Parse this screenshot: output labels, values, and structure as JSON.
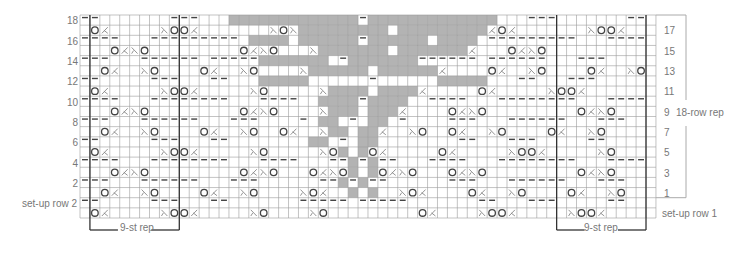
{
  "chart_data": {
    "type": "knitting-chart",
    "columns": 58,
    "rows_total": 20,
    "legend_symbols": {
      ".": "knit",
      "-": "purl",
      "o": "yarn-over",
      "/": "k2tog",
      "\\": "ssk",
      "#": "no-stitch"
    },
    "grid": [
      "--.......---...#############-#############...---.......--",
      ".o/.....\\oo/.......\\o\\#########.#########/o/.......\\oo/...",
      "----...---------.####.######-######.####.---------...----",
      "...o/\\o.........o/\\o...\\#######.#######/...o/\\o.........",
      "---...------.-----#######.-#######------.------...---....",
      "..o/..\\o....o/..\\o....\\######.######/....o/..\\o....o/..\\o",
      "--.....---...--...#####......-......#####...--...---.....",
      ".o/.....\\oo/.....\\o.....\\####.####/.....o/.....\\oo/.....",
      "----...--------...----..####-####..----...--------...----",
      "...o/\\o.........o/\\o....\\###.###/....o/\\o.........o/\\o..",
      "---...------...---....-.##.-.##.-....---...------...---..",
      "..o/..\\o....o/..\\o..o/..\\##.##/..\\o..o/..\\o....o/..\\o...",
      "--.....---...--........##.-.##........--...---.....--....",
      ".o/.....\\oo/.....\\o.....\\o#.#o/.....o/.....\\oo/.....\\o...",
      "----...--------...----...--#-#--...----...--------...----",
      "...o/\\o.........o/\\o...o/\\o#.#o/\\o...o/\\o.........o/\\o...",
      "---...------...---......--#-#--......---...------...---..",
      "..o/..\\o....o/..\\o....\\o/..#.#..\\o/....o/..\\o....o/..\\o..",
      "--.....---...--.......-----.-----.......--...---.....--..",
      ".o/.....\\oo/.....\\o....\\o.........o/....\\oo/.....\\oo/.....\\o."
    ]
  },
  "labels": {
    "left_rows": [
      "18",
      "16",
      "14",
      "12",
      "10",
      "8",
      "6",
      "4",
      "2",
      "set-up row 2"
    ],
    "right_rows": [
      "17",
      "15",
      "13",
      "11",
      "9",
      "7",
      "5",
      "3",
      "1",
      "set-up row 1"
    ],
    "row_rep": "18-row rep",
    "st_rep_left": "9-st rep",
    "st_rep_right": "9-st rep"
  },
  "colors": {
    "grid_line": "#9a9a9a",
    "thick_line": "#333333",
    "no_stitch": "#b3b3b3",
    "symbol": "#444444",
    "label": "#777777"
  }
}
